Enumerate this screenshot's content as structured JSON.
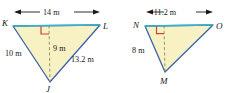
{
  "figure": {
    "background_color": "#ffffff",
    "fill_color": "#f7f1c4",
    "edge_color": "#3c63a8",
    "top_edge_color": "#2fb5cc",
    "right_angle_color": "#d1442b",
    "dash_color": "#8a8a5a",
    "text_color": "#1a1a1a"
  },
  "triangles": [
    {
      "name": "triangle-KLJ",
      "vertices": [
        {
          "label": "K",
          "x": 13,
          "y": 26
        },
        {
          "label": "L",
          "x": 100,
          "y": 25
        },
        {
          "label": "J",
          "x": 50,
          "y": 82
        }
      ],
      "vertex_labels": [
        {
          "name": "vertex-label-k",
          "text": "K",
          "x": 3,
          "y": 25
        },
        {
          "name": "vertex-label-l",
          "text": "L",
          "x": 103,
          "y": 28
        },
        {
          "name": "vertex-label-j",
          "text": "J",
          "x": 47,
          "y": 91
        }
      ],
      "altitude": {
        "name": "altitude-9m",
        "from_x": 49,
        "from_y": 25,
        "to_x": 50,
        "to_y": 82,
        "label": "9 m",
        "label_x": 53,
        "label_y": 51
      },
      "right_angle": {
        "name": "right-angle-mark-kl",
        "x": 40,
        "y": 26,
        "size": 8
      },
      "dimension": {
        "name": "dimension-14m",
        "label": "14 m",
        "label_x": 56,
        "label_y": 14,
        "line_y": 12,
        "x1": 15,
        "x2": 99
      },
      "side_labels": [
        {
          "name": "side-label-kj",
          "text": "10 m",
          "x": 7,
          "y": 56
        },
        {
          "name": "side-label-lj",
          "text": "13.2 m",
          "x": 75,
          "y": 62
        }
      ]
    },
    {
      "name": "triangle-NOM",
      "vertices": [
        {
          "label": "N",
          "x": 145,
          "y": 26
        },
        {
          "label": "O",
          "x": 213,
          "y": 25
        },
        {
          "label": "M",
          "x": 165,
          "y": 72
        }
      ],
      "vertex_labels": [
        {
          "name": "vertex-label-n",
          "text": "N",
          "x": 134,
          "y": 27
        },
        {
          "name": "vertex-label-o",
          "text": "O",
          "x": 216,
          "y": 28
        },
        {
          "name": "vertex-label-m",
          "text": "M",
          "x": 160,
          "y": 83
        }
      ],
      "altitude": {
        "name": "altitude-unlabeled",
        "from_x": 164,
        "from_y": 25,
        "to_x": 165,
        "to_y": 72,
        "label": "",
        "label_x": 0,
        "label_y": 0
      },
      "right_angle": {
        "name": "right-angle-mark-no",
        "x": 156,
        "y": 26,
        "size": 8
      },
      "dimension": {
        "name": "dimension-11-2m",
        "label": "11.2 m",
        "label_x": 179,
        "label_y": 14,
        "line_y": 12,
        "x1": 147,
        "x2": 212
      },
      "side_labels": [
        {
          "name": "side-label-nm",
          "text": "8 m",
          "x": 134,
          "y": 53
        }
      ]
    }
  ]
}
